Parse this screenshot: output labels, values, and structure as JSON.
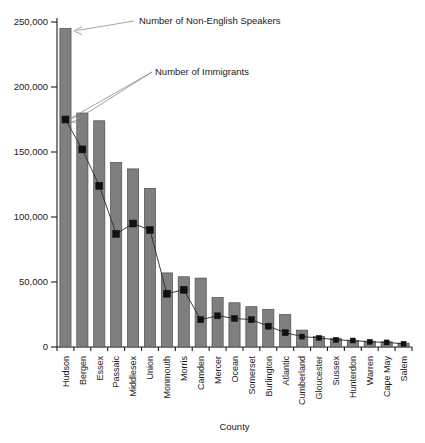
{
  "chart_data": {
    "type": "bar",
    "title": "",
    "subtitle": "",
    "xlabel": "County",
    "ylabel": "",
    "ylim": [
      0,
      250000
    ],
    "yticks": [
      0,
      50000,
      100000,
      150000,
      200000,
      250000
    ],
    "ytick_labels": [
      "0",
      "50,000",
      "100,000",
      "150,000",
      "200,000",
      "250,000"
    ],
    "grid": false,
    "legend_position": "annotations",
    "categories": [
      "Hudson",
      "Bergen",
      "Essex",
      "Passaic",
      "Middlesex",
      "Union",
      "Monmouth",
      "Morris",
      "Camden",
      "Mercer",
      "Ocean",
      "Somerset",
      "Burlington",
      "Atlantic",
      "Cumberland",
      "Gloucester",
      "Sussex",
      "Hunterdon",
      "Warren",
      "Cape May",
      "Salem"
    ],
    "series": [
      {
        "name": "Number of Non-English Speakers",
        "render": "bar",
        "values": [
          245000,
          180000,
          174000,
          142000,
          137000,
          122000,
          57000,
          54000,
          53000,
          38000,
          34000,
          31000,
          29000,
          25000,
          13000,
          8000,
          6500,
          5000,
          4500,
          4000,
          3000
        ]
      },
      {
        "name": "Number of Immigrants",
        "render": "line-marker",
        "values": [
          175000,
          152000,
          124000,
          87000,
          95000,
          90000,
          41000,
          44000,
          21000,
          24000,
          22000,
          21000,
          16000,
          11000,
          8000,
          7000,
          5500,
          5000,
          4000,
          3500,
          2500
        ]
      }
    ],
    "annotations": [
      {
        "id": "non-english-speakers",
        "text": "Number of Non-English Speakers",
        "points_to": "Hudson bar top"
      },
      {
        "id": "immigrants",
        "text": "Number of Immigrants",
        "points_to": "Hudson marker"
      }
    ]
  }
}
